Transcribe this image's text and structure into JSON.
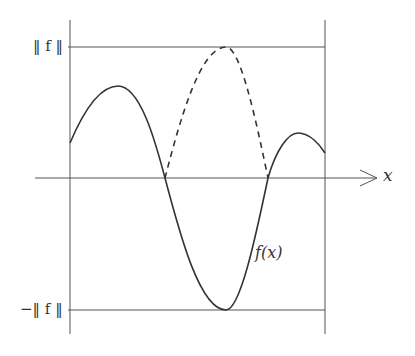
{
  "labels": {
    "top_norm": "‖ f ‖",
    "bottom_norm": "−‖ f ‖",
    "x_axis": "x",
    "curve": "f(x)"
  },
  "colors": {
    "stroke": "#333333",
    "frame": "#555555"
  }
}
